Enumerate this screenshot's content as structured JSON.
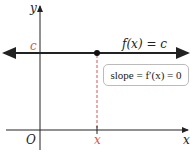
{
  "diagram": {
    "axes": {
      "x_label": "x",
      "y_label": "y",
      "origin_label": "O"
    },
    "function_label": "f(x) = c",
    "c_label": "c",
    "x_tick_label": "x",
    "slope_box": "slope = f′(x) = 0",
    "colors": {
      "accent": "#d9534f",
      "line": "#222222",
      "box_border": "#bbbbbb"
    }
  }
}
